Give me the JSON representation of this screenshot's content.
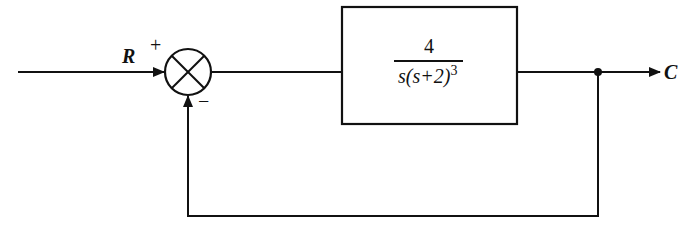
{
  "diagram": {
    "type": "block-diagram",
    "input_label": "R",
    "output_label": "C",
    "summing_junction": {
      "plus_sign": "+",
      "minus_sign": "−"
    },
    "plant": {
      "numerator": "4",
      "denominator_prefix": "s(s+2)",
      "denominator_exponent": "3"
    },
    "colors": {
      "stroke": "#111111",
      "background": "#ffffff"
    }
  }
}
